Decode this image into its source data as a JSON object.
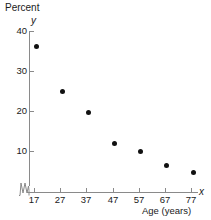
{
  "chart_data": {
    "type": "scatter",
    "title": "Percent",
    "xlabel": "Age (years)",
    "ylabel": "Percent",
    "x_axis_symbol": "x",
    "y_axis_symbol": "y",
    "x": [
      17,
      27,
      37,
      47,
      57,
      67,
      77
    ],
    "values": [
      36.2,
      24.8,
      19.6,
      11.8,
      9.8,
      6.4,
      4.6
    ],
    "series": [
      {
        "name": "Percent",
        "values": [
          36.2,
          24.8,
          19.6,
          11.8,
          9.8,
          6.4,
          4.6
        ]
      }
    ],
    "categories": [
      "17",
      "27",
      "37",
      "47",
      "57",
      "67",
      "77"
    ],
    "x_tick_labels": [
      "17",
      "27",
      "37",
      "47",
      "57",
      "67",
      "77"
    ],
    "y_tick_labels": [
      "10",
      "20",
      "30",
      "40"
    ],
    "y_ticks": [
      10,
      20,
      30,
      40
    ],
    "xlim": [
      12,
      82
    ],
    "ylim": [
      0,
      40
    ],
    "grid": false,
    "legend": false,
    "axis_break_y": true,
    "point_color": "#111111",
    "axis_color": "#8a8a8a",
    "text_color": "#1a1a1a"
  },
  "labels": {
    "percent_title": "Percent",
    "y_symbol": "y",
    "x_symbol": "x",
    "x_caption": "Age (years)"
  },
  "y_ticks": [
    {
      "label": "40"
    },
    {
      "label": "30"
    },
    {
      "label": "20"
    },
    {
      "label": "10"
    }
  ],
  "x_ticks": [
    {
      "label": "17"
    },
    {
      "label": "27"
    },
    {
      "label": "37"
    },
    {
      "label": "47"
    },
    {
      "label": "57"
    },
    {
      "label": "67"
    },
    {
      "label": "77"
    }
  ]
}
